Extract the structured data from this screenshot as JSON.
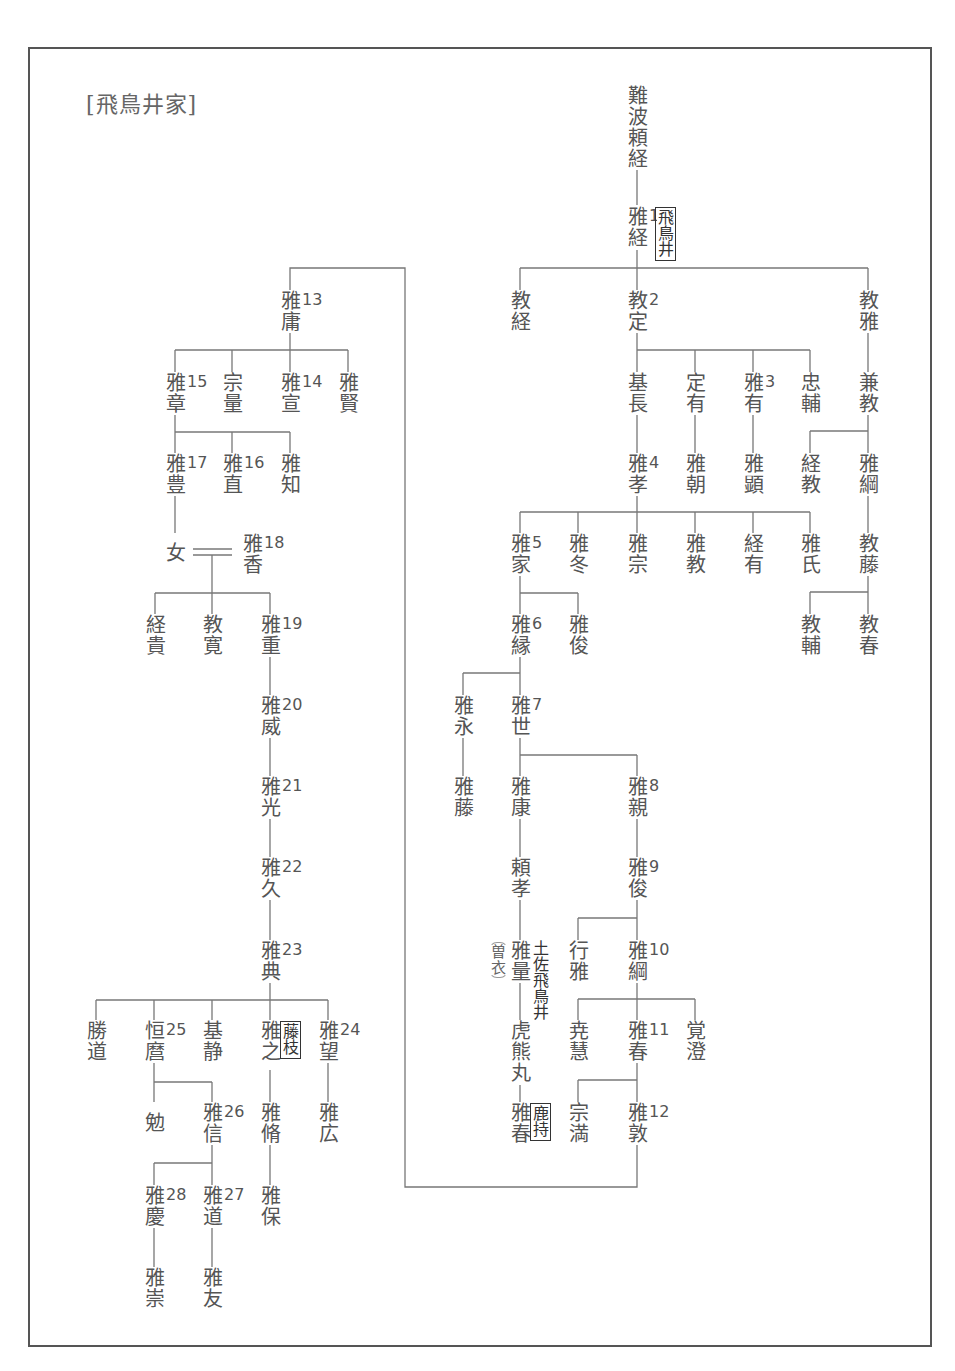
{
  "title": "[飛鳥井家]",
  "colors": {
    "line": "#777777",
    "text": "#555555",
    "frame": "#555555"
  },
  "nodes": {
    "naniwa_yoritsune": {
      "name": "難波頼経"
    },
    "masatsune": {
      "name": "雅経",
      "num": "1",
      "note": "飛鳥井"
    },
    "noritsune": {
      "name": "教経"
    },
    "norisada": {
      "name": "教定",
      "num": "2"
    },
    "norimasa": {
      "name": "教雅"
    },
    "motonaga": {
      "name": "基長"
    },
    "sadaari": {
      "name": "定有"
    },
    "masaari": {
      "name": "雅有",
      "num": "3"
    },
    "tadasuke": {
      "name": "忠輔"
    },
    "kanenori": {
      "name": "兼教"
    },
    "masataka4": {
      "name": "雅孝",
      "num": "4"
    },
    "masatomo": {
      "name": "雅朝"
    },
    "masaaki_ken": {
      "name": "雅顕"
    },
    "tsunenori": {
      "name": "経教"
    },
    "masatsuna_kou": {
      "name": "雅綱"
    },
    "masaie": {
      "name": "雅家",
      "num": "5"
    },
    "masafuyu": {
      "name": "雅冬"
    },
    "masamune": {
      "name": "雅宗"
    },
    "masanori": {
      "name": "雅教"
    },
    "tsuneari": {
      "name": "経有"
    },
    "masauji": {
      "name": "雅氏"
    },
    "norifuji": {
      "name": "教藤"
    },
    "norisuke": {
      "name": "教輔"
    },
    "noriharu": {
      "name": "教春"
    },
    "masayori": {
      "name": "雅縁",
      "num": "6"
    },
    "masatoshi_shun": {
      "name": "雅俊"
    },
    "masanaga": {
      "name": "雅永"
    },
    "masayo": {
      "name": "雅世",
      "num": "7"
    },
    "masafuji": {
      "name": "雅藤"
    },
    "masayasu": {
      "name": "雅康"
    },
    "masachika": {
      "name": "雅親",
      "num": "8"
    },
    "yoritaka": {
      "name": "頼孝"
    },
    "masatoshi9": {
      "name": "雅俊",
      "num": "9"
    },
    "masakazu": {
      "name": "雅量",
      "note": "土佐飛鳥井",
      "side_note": "曽衣"
    },
    "yukimasa": {
      "name": "行雅"
    },
    "masatsuna10": {
      "name": "雅綱",
      "num": "10"
    },
    "torakumamaru": {
      "name": "虎熊丸"
    },
    "gyoue": {
      "name": "尭慧"
    },
    "masaharu11": {
      "name": "雅春",
      "num": "11"
    },
    "kakuchou": {
      "name": "覚澄"
    },
    "masaharu_kashimochi": {
      "name": "雅春",
      "note": "鹿持"
    },
    "muneman": {
      "name": "宗満"
    },
    "masaatsu": {
      "name": "雅敦",
      "num": "12"
    },
    "masatsune13": {
      "name": "雅庸",
      "num": "13"
    },
    "masaaki15": {
      "name": "雅章",
      "num": "15"
    },
    "munekazu": {
      "name": "宗量"
    },
    "masanobu14": {
      "name": "雅宣",
      "num": "14"
    },
    "masakata": {
      "name": "雅賢"
    },
    "masatoyo17": {
      "name": "雅豊",
      "num": "17"
    },
    "masanao16": {
      "name": "雅直",
      "num": "16"
    },
    "masatomo_chi": {
      "name": "雅知"
    },
    "onna": {
      "name": "女"
    },
    "masaka18": {
      "name": "雅香",
      "num": "18"
    },
    "tsunetaka": {
      "name": "経貴"
    },
    "norihiro": {
      "name": "教寛"
    },
    "masashige19": {
      "name": "雅重",
      "num": "19"
    },
    "masatake20": {
      "name": "雅威",
      "num": "20"
    },
    "masamitsu21": {
      "name": "雅光",
      "num": "21"
    },
    "masahisa22": {
      "name": "雅久",
      "num": "22"
    },
    "masanori23": {
      "name": "雅典",
      "num": "23"
    },
    "katsumichi": {
      "name": "勝道"
    },
    "tsunemaro25": {
      "name": "恒麿",
      "num": "25"
    },
    "motoshizu": {
      "name": "基静"
    },
    "masayuki": {
      "name": "雅之",
      "note": "藤枝"
    },
    "masamochi24": {
      "name": "雅望",
      "num": "24"
    },
    "ben": {
      "name": "勉"
    },
    "masanobu26": {
      "name": "雅信",
      "num": "26"
    },
    "masayu": {
      "name": "雅脩"
    },
    "masahiro": {
      "name": "雅広"
    },
    "masayoshi28": {
      "name": "雅慶",
      "num": "28"
    },
    "masamichi27": {
      "name": "雅道",
      "num": "27"
    },
    "masayasu_ho": {
      "name": "雅保"
    },
    "masataka_su": {
      "name": "雅崇"
    },
    "masatomo_yu": {
      "name": "雅友"
    }
  }
}
